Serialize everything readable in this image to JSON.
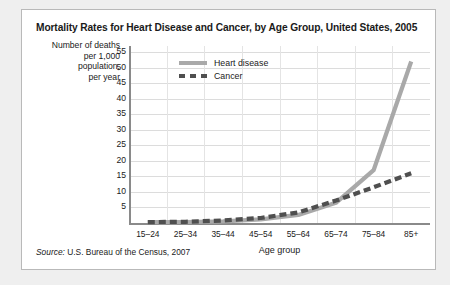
{
  "card": {
    "title": "Mortality Rates for Heart Disease and Cancer, by Age Group, United States, 2005",
    "source_prefix": "Source:",
    "source_text": " U.S. Bureau of the Census, 2007"
  },
  "chart_data": {
    "type": "line",
    "title": "Mortality Rates for Heart Disease and Cancer, by Age Group, United States, 2005",
    "xlabel": "Age group",
    "ylabel": "Number of deaths per 1,000 population, per year",
    "ylabel_lines": [
      "Number of deaths",
      "per 1,000",
      "population,",
      "per year"
    ],
    "categories": [
      "15–24",
      "25–34",
      "35–44",
      "45–54",
      "55–64",
      "65–74",
      "75–84",
      "85+"
    ],
    "yticks": [
      5,
      10,
      15,
      20,
      25,
      30,
      35,
      40,
      45,
      50,
      55
    ],
    "ylim": [
      0,
      57
    ],
    "grid": true,
    "legend_position": "top-left",
    "series": [
      {
        "name": "Heart disease",
        "style": "solid",
        "color": "#a9a9a9",
        "values": [
          0.3,
          0.3,
          0.5,
          1.2,
          2.6,
          6.5,
          17.0,
          52.0
        ]
      },
      {
        "name": "Cancer",
        "style": "dashed",
        "color": "#4f4f4f",
        "values": [
          0.3,
          0.4,
          0.8,
          1.6,
          3.4,
          7.2,
          11.5,
          16.0
        ]
      }
    ]
  }
}
